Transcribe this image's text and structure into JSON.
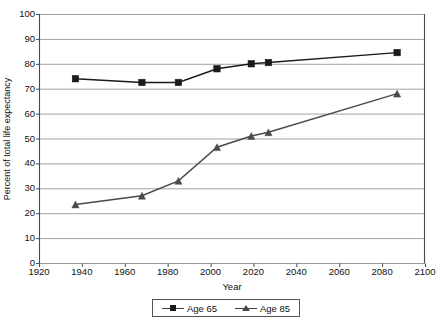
{
  "chart_data": {
    "type": "line",
    "title": "",
    "xlabel": "Year",
    "ylabel": "Percent of total life expectancy",
    "xlim": [
      1920,
      2100
    ],
    "ylim": [
      0,
      100
    ],
    "xticks": [
      1920,
      1940,
      1960,
      1980,
      2000,
      2020,
      2040,
      2060,
      2080,
      2100
    ],
    "yticks": [
      0,
      10,
      20,
      30,
      40,
      50,
      60,
      70,
      80,
      90,
      100
    ],
    "grid": "horizontal",
    "legend_position": "bottom",
    "series": [
      {
        "name": "Age 65",
        "marker": "square",
        "color": "#1a1a1a",
        "x": [
          1937,
          1968,
          1985,
          2003,
          2019,
          2027,
          2087
        ],
        "values": [
          74,
          72.5,
          72.5,
          78,
          80,
          80.5,
          84.5
        ]
      },
      {
        "name": "Age 85",
        "marker": "triangle",
        "color": "#4a4a4a",
        "x": [
          1937,
          1968,
          1985,
          2003,
          2019,
          2027,
          2087
        ],
        "values": [
          23.5,
          27,
          33,
          46.5,
          51,
          52.5,
          68
        ]
      }
    ]
  },
  "legend": {
    "entries": [
      {
        "label": "Age 65",
        "marker": "square"
      },
      {
        "label": "Age 85",
        "marker": "triangle"
      }
    ]
  },
  "axes": {
    "x_title": "Year",
    "y_title": "Percent of total life expectancy"
  }
}
